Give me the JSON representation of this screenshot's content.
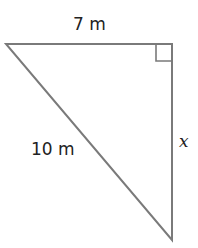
{
  "diagram": {
    "type": "right-triangle",
    "stroke_color": "#7a7a7a",
    "text_color": "#222222",
    "vertices": {
      "top_left": [
        6,
        44
      ],
      "right_angle": [
        172,
        44
      ],
      "bottom": [
        172,
        240
      ]
    },
    "right_angle_marker": true,
    "labels": {
      "top_side": "7 m",
      "hypotenuse": "10 m",
      "right_side": "x"
    }
  }
}
